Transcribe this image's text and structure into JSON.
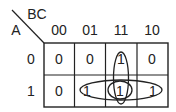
{
  "kmap": {
    "row_variable": "A",
    "col_variable": "BC",
    "col_headers": [
      "00",
      "01",
      "11",
      "10"
    ],
    "row_headers": [
      "0",
      "1"
    ],
    "cells": [
      [
        "0",
        "0",
        "1",
        "0"
      ],
      [
        "0",
        "1",
        "1",
        "1"
      ]
    ],
    "groups": [
      {
        "name": "BC",
        "cells": [
          [
            0,
            2
          ],
          [
            1,
            2
          ]
        ],
        "shape": "vertical-ellipse"
      },
      {
        "name": "A(B+C) row group",
        "cells": [
          [
            1,
            1
          ],
          [
            1,
            2
          ],
          [
            1,
            3
          ]
        ],
        "shape": "horizontal-ellipse"
      },
      {
        "name": "ABC single",
        "cells": [
          [
            1,
            2
          ]
        ],
        "shape": "small-ellipse"
      }
    ],
    "line_color": "#222222"
  }
}
